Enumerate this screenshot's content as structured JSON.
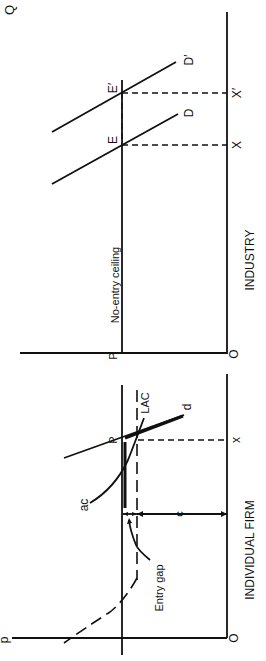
{
  "diagram": {
    "orientation": "rotated 90 degrees counter-clockwise",
    "panels": {
      "firm": {
        "title": "INDIVIDUAL FIRM",
        "origin_label": "O",
        "price_axis_label": "p",
        "price_level_label": "P",
        "quantity_label": "x",
        "curves": {
          "lac": "LAC",
          "ac": "ac",
          "demand": "d"
        },
        "annotations": {
          "entry_gap": "Entry gap",
          "cost_distance": "c"
        }
      },
      "industry": {
        "title": "INDUSTRY",
        "origin_label": "O",
        "price_level_label": "P",
        "quantity_axis_label": "Q",
        "ceiling_label": "No-entry ceiling",
        "curves": {
          "d1": "D",
          "d2": "D′"
        },
        "equilibria": {
          "e1": "E",
          "e2": "E′"
        },
        "quantities": {
          "x1": "X",
          "x2": "X′"
        }
      }
    }
  }
}
